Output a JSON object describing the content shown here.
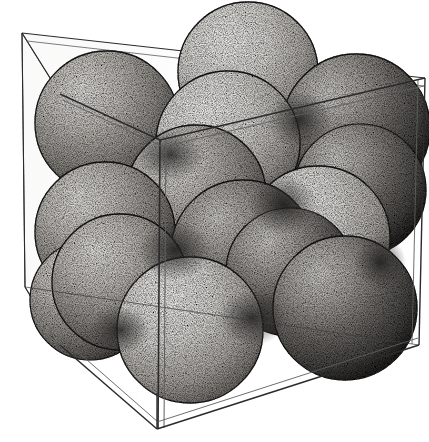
{
  "figure": {
    "style": "stipple line engraving",
    "caption": "",
    "width": 429,
    "height": 442
  },
  "colors": {
    "background": "#ffffff",
    "ink": "#1a1a1a",
    "line": "#2b2b2b",
    "sphere_light": "#d8d6d2",
    "sphere_mid": "#9e9b96",
    "sphere_dark": "#5d5a56",
    "sphere_edge": "#1f1f1f",
    "panel_tint": "#f2f1ee",
    "floor_tint": "#ebe9e5",
    "shadow": "#c9c7c3"
  },
  "cube": {
    "name": "transparent cubic unit cell box",
    "edge_style": "double-line transparent panel",
    "vertices": {
      "back_top_left": [
        22,
        33
      ],
      "back_top_right": [
        425,
        78
      ],
      "front_top_left": [
        60,
        94
      ],
      "front_top_right": [
        160,
        140
      ],
      "back_bottom_left": [
        25,
        287
      ],
      "back_bottom_right": [
        419,
        345
      ],
      "front_bottom_left": [
        60,
        345
      ],
      "front_bottom_right": [
        157,
        429
      ]
    },
    "panels": [
      {
        "name": "left-wall-panel",
        "opacity": 0.1
      },
      {
        "name": "back-wall-panel",
        "opacity": 0.04
      },
      {
        "name": "floor-panel",
        "opacity": 0.14
      }
    ],
    "interior_edge": {
      "name": "interior-vertical-edge",
      "from": [
        160,
        140
      ],
      "to": [
        158,
        428
      ]
    }
  },
  "spheres": {
    "count": 16,
    "radius_nominal": 72,
    "arrangement": "face-centered cubic, two visible layers",
    "items": [
      {
        "id": "s01",
        "label": "top-back-left-corner-sphere",
        "cx": 107,
        "cy": 123,
        "r": 72,
        "layer": "top",
        "shade": "mid"
      },
      {
        "id": "s02",
        "label": "top-back-center-sphere",
        "cx": 248,
        "cy": 72,
        "r": 70,
        "layer": "top",
        "shade": "light"
      },
      {
        "id": "s03",
        "label": "top-back-right-corner-sphere",
        "cx": 356,
        "cy": 128,
        "r": 74,
        "layer": "top",
        "shade": "dark"
      },
      {
        "id": "s04",
        "label": "top-face-center-sphere",
        "cx": 228,
        "cy": 143,
        "r": 72,
        "layer": "top",
        "shade": "light"
      },
      {
        "id": "s05",
        "label": "top-front-center-sphere",
        "cx": 196,
        "cy": 195,
        "r": 70,
        "layer": "top",
        "shade": "mid"
      },
      {
        "id": "s06",
        "label": "mid-left-face-sphere",
        "cx": 105,
        "cy": 232,
        "r": 70,
        "layer": "middle",
        "shade": "mid"
      },
      {
        "id": "s07",
        "label": "mid-left-front-sphere",
        "cx": 120,
        "cy": 282,
        "r": 68,
        "layer": "middle",
        "shade": "mid"
      },
      {
        "id": "s08",
        "label": "mid-center-sphere",
        "cx": 243,
        "cy": 252,
        "r": 72,
        "layer": "middle",
        "shade": "dark"
      },
      {
        "id": "s09",
        "label": "mid-right-face-sphere",
        "cx": 318,
        "cy": 238,
        "r": 72,
        "layer": "middle",
        "shade": "light"
      },
      {
        "id": "s10",
        "label": "mid-right-back-sphere",
        "cx": 360,
        "cy": 190,
        "r": 66,
        "layer": "middle",
        "shade": "dark"
      },
      {
        "id": "s11",
        "label": "bottom-front-center-sphere",
        "cx": 190,
        "cy": 330,
        "r": 73,
        "layer": "bottom",
        "shade": "light"
      },
      {
        "id": "s12",
        "label": "bottom-right-corner-sphere",
        "cx": 345,
        "cy": 308,
        "r": 72,
        "layer": "bottom",
        "shade": "dark"
      },
      {
        "id": "s13",
        "label": "bottom-back-right-sphere",
        "cx": 290,
        "cy": 272,
        "r": 64,
        "layer": "bottom",
        "shade": "dark"
      },
      {
        "id": "s14",
        "label": "bottom-left-corner-sphere",
        "cx": 90,
        "cy": 300,
        "r": 60,
        "layer": "bottom",
        "shade": "mid"
      },
      {
        "id": "s15",
        "label": "upper-left-back-sphere",
        "cx": 150,
        "cy": 165,
        "r": 58,
        "layer": "middle",
        "shade": "dark"
      },
      {
        "id": "s16",
        "label": "back-center-hidden-sphere",
        "cx": 300,
        "cy": 170,
        "r": 56,
        "layer": "middle",
        "shade": "dark"
      }
    ]
  },
  "shadow": {
    "name": "cast-shadow",
    "description": "soft stipple shadow at lower-left outside the cube"
  },
  "labels": {
    "alt_text": "Ink stipple drawing of sixteen close-packed spheres stacked inside an open transparent cube, illustrating face-centered cubic packing."
  }
}
